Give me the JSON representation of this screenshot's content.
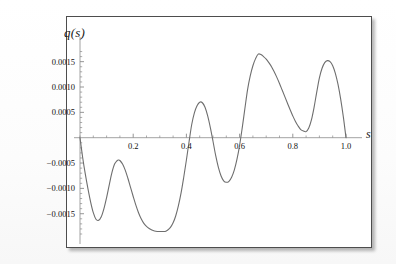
{
  "figure": {
    "background_color": "#ffffff",
    "frame_color": "#4d4d4d",
    "curve_color": "#6e6e6e",
    "axis_color": "#8a8a8a",
    "y_axis_label": "q(s)",
    "x_axis_label": "s"
  },
  "chart_data": {
    "type": "line",
    "title": "",
    "subtitle": "",
    "xlabel": "s",
    "ylabel": "q(s)",
    "xlim": [
      0.0,
      1.0
    ],
    "ylim": [
      -0.0019,
      0.00175
    ],
    "grid": false,
    "legend": null,
    "x_ticks": [
      0.2,
      0.4,
      0.6,
      0.8,
      1.0
    ],
    "x_tick_labels": [
      "0.2",
      "0.4",
      "0.6",
      "0.8",
      "1.0"
    ],
    "x_minor_tick_step": 0.05,
    "y_ticks": [
      0.0015,
      0.001,
      0.0005,
      -0.0005,
      -0.001,
      -0.0015
    ],
    "y_tick_labels": [
      "0.0015",
      "0.0010",
      "0.0005",
      "-0.0005",
      "-0.0010",
      "-0.0015"
    ],
    "y_minor_tick_step": 0.0001,
    "series": [
      {
        "name": "q(s)",
        "color": "#6e6e6e",
        "x": [
          0.0,
          0.01,
          0.02,
          0.03,
          0.04,
          0.05,
          0.06,
          0.07,
          0.08,
          0.09,
          0.1,
          0.11,
          0.12,
          0.13,
          0.14,
          0.145,
          0.15,
          0.16,
          0.17,
          0.18,
          0.19,
          0.2,
          0.21,
          0.22,
          0.23,
          0.24,
          0.25,
          0.26,
          0.27,
          0.28,
          0.29,
          0.3,
          0.31,
          0.32,
          0.33,
          0.34,
          0.35,
          0.36,
          0.37,
          0.38,
          0.39,
          0.4,
          0.41,
          0.42,
          0.43,
          0.44,
          0.45,
          0.46,
          0.47,
          0.48,
          0.49,
          0.5,
          0.51,
          0.52,
          0.53,
          0.54,
          0.55,
          0.56,
          0.57,
          0.58,
          0.59,
          0.6,
          0.61,
          0.62,
          0.63,
          0.64,
          0.65,
          0.66,
          0.67,
          0.68,
          0.69,
          0.7,
          0.71,
          0.72,
          0.73,
          0.74,
          0.75,
          0.76,
          0.77,
          0.78,
          0.79,
          0.8,
          0.81,
          0.82,
          0.83,
          0.84,
          0.85,
          0.86,
          0.87,
          0.88,
          0.89,
          0.9,
          0.91,
          0.92,
          0.93,
          0.94,
          0.95,
          0.96,
          0.97,
          0.98,
          0.99,
          1.0
        ],
        "y": [
          0.0,
          -0.00039,
          -0.00072,
          -0.00101,
          -0.00127,
          -0.00148,
          -0.00161,
          -0.00163,
          -0.00156,
          -0.0014,
          -0.00118,
          -0.00093,
          -0.00069,
          -0.00052,
          -0.00045,
          -0.00044,
          -0.00045,
          -0.00052,
          -0.00064,
          -0.0008,
          -0.00098,
          -0.00116,
          -0.00133,
          -0.00148,
          -0.0016,
          -0.00169,
          -0.00175,
          -0.00179,
          -0.00182,
          -0.00184,
          -0.00185,
          -0.00185,
          -0.00185,
          -0.00185,
          -0.00182,
          -0.00177,
          -0.00168,
          -0.00154,
          -0.00134,
          -0.00109,
          -0.00078,
          -0.00044,
          -8e-05,
          0.00026,
          0.00049,
          0.00063,
          0.0007,
          0.00069,
          0.0006,
          0.00043,
          0.0002,
          -7e-05,
          -0.00035,
          -0.00058,
          -0.00075,
          -0.00085,
          -0.00088,
          -0.00086,
          -0.00078,
          -0.00064,
          -0.00043,
          -0.00015,
          0.0002,
          0.00058,
          0.00095,
          0.00122,
          0.00142,
          0.00156,
          0.00165,
          0.00164,
          0.0016,
          0.00155,
          0.00148,
          0.0014,
          0.0013,
          0.00119,
          0.00107,
          0.00094,
          0.00081,
          0.00068,
          0.00055,
          0.00043,
          0.00032,
          0.00023,
          0.00016,
          0.00013,
          0.00012,
          0.00019,
          0.00035,
          0.0006,
          0.0009,
          0.00118,
          0.00137,
          0.00148,
          0.00152,
          0.0015,
          0.00142,
          0.00127,
          0.00105,
          0.00076,
          0.00041,
          0.0
        ]
      }
    ]
  }
}
